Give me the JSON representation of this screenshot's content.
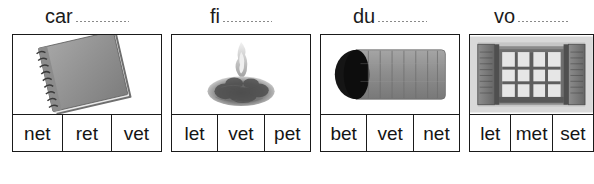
{
  "worksheet": {
    "title": "Syllable and word matching worksheet",
    "panels": [
      {
        "syllable": "car",
        "dotted_line": "............",
        "picture_name": "spiral-notebook-photo",
        "picture_alt": "spiral-bound notebook",
        "words": [
          "net",
          "ret",
          "vet"
        ]
      },
      {
        "syllable": "fi",
        "dotted_line": "............",
        "picture_name": "campfire-photo",
        "picture_alt": "burning fire with flame",
        "words": [
          "let",
          "vet",
          "pet"
        ]
      },
      {
        "syllable": "du",
        "dotted_line": "............",
        "picture_name": "sleeping-bag-photo",
        "picture_alt": "quilted sleeping bag duvet",
        "words": [
          "bet",
          "vet",
          "net"
        ]
      },
      {
        "syllable": "vo",
        "dotted_line": "............",
        "picture_name": "window-shutters-photo",
        "picture_alt": "window with open wooden shutters",
        "words": [
          "let",
          "met",
          "set"
        ]
      }
    ]
  },
  "colors": {
    "ink": "#1a1a1a",
    "text": "#141414",
    "dots": "#8a8a8a",
    "paper": "#ffffff"
  }
}
